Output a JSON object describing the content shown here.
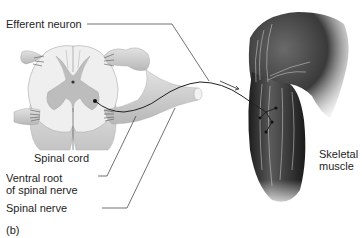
{
  "figure": {
    "panel_label": "(b)",
    "labels": {
      "efferent_neuron": "Efferent neuron",
      "spinal_cord": "Spinal cord",
      "ventral_root_line1": "Ventral root",
      "ventral_root_line2": "of spinal nerve",
      "spinal_nerve": "Spinal nerve",
      "skeletal_line1": "Skeletal",
      "skeletal_line2": "muscle"
    },
    "colors": {
      "background": "#ffffff",
      "cord_white_matter": "#ededed",
      "cord_gray_matter": "#b9b9b9",
      "cord_shadow": "#9a9a9a",
      "muscle_dark": "#2a2a2a",
      "muscle_light": "#d9d9d9",
      "neuron_line": "#222222",
      "leader_line": "#333333"
    }
  }
}
